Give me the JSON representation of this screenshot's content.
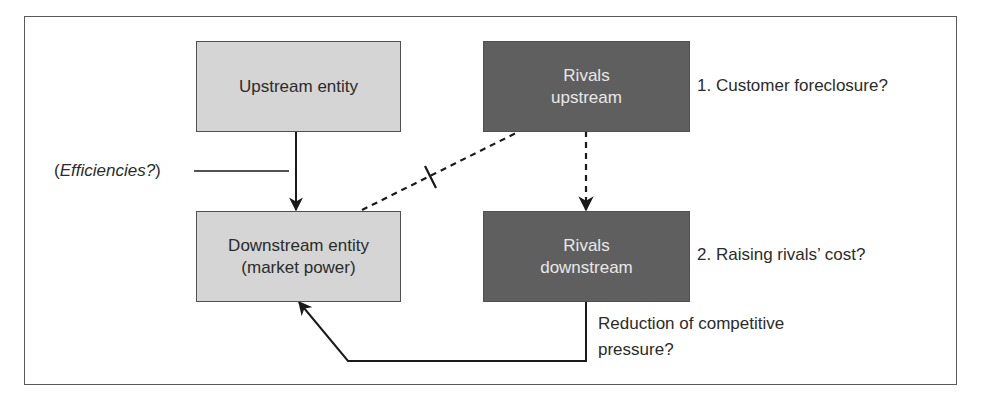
{
  "diagram": {
    "boxes": {
      "upstream_entity": {
        "label": "Upstream entity",
        "fill": "#d5d5d5"
      },
      "downstream_entity": {
        "line1": "Downstream entity",
        "line2": "(market power)",
        "fill": "#d5d5d5"
      },
      "rivals_upstream": {
        "line1": "Rivals",
        "line2": "upstream",
        "fill": "#5f5f5f"
      },
      "rivals_downstream": {
        "line1": "Rivals",
        "line2": "downstream",
        "fill": "#5f5f5f"
      }
    },
    "annotations": {
      "efficiencies": {
        "open": "(",
        "text": "Efficiencies?",
        "close": ")"
      },
      "customer_foreclosure": "1. Customer foreclosure?",
      "raising_rivals_cost": "2. Raising rivals’ cost?",
      "reduction_line1": "Reduction of competitive",
      "reduction_line2": "pressure?"
    },
    "connectors": [
      {
        "from": "upstream_entity",
        "to": "downstream_entity",
        "style": "solid",
        "arrow": "end"
      },
      {
        "from": "rivals_upstream",
        "to": "downstream_entity",
        "style": "dashed",
        "broken": true
      },
      {
        "from": "rivals_upstream",
        "to": "rivals_downstream",
        "style": "dashed",
        "arrow": "end"
      },
      {
        "from": "rivals_downstream",
        "to": "downstream_entity",
        "style": "solid",
        "arrow": "end"
      },
      {
        "from": "efficiencies_label",
        "to": "upstream_downstream_link",
        "style": "solid"
      }
    ],
    "colors": {
      "light_box": "#d5d5d5",
      "dark_box": "#5f5f5f",
      "dark_box_text": "#e8e8e8",
      "line": "#1a1a1a"
    }
  }
}
